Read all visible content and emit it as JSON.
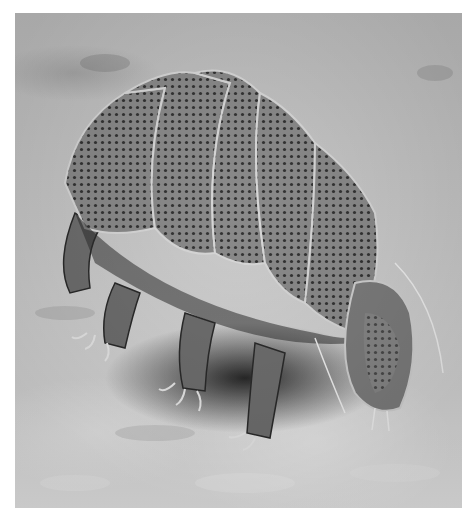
{
  "image": {
    "subject": "tardigrade",
    "style": "grayscale scanning electron micrograph",
    "colors": {
      "background": "#ffffff",
      "substrate_light": "#d8d8d8",
      "substrate_dark": "#a8a8a8",
      "body_mid": "#7a7a7a",
      "body_dark": "#3a3a3a",
      "shadow": "#1e1e1e"
    }
  }
}
